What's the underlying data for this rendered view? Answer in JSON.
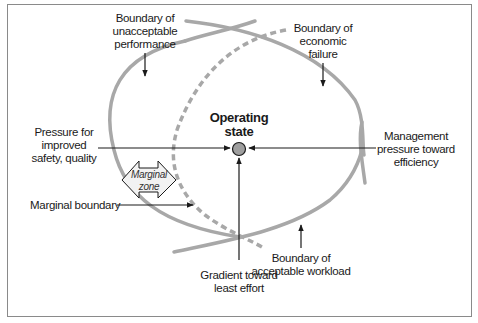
{
  "diagram": {
    "colors": {
      "boundary": "#a8a8a8",
      "arrow": "#1a1a1a",
      "operating_state_fill": "#9e9e9e",
      "frame": "#8a8a8a",
      "marginal_zone_fill": "#f2f2f2"
    },
    "center": {
      "label_line1": "Operating",
      "label_line2": "state"
    },
    "boundaries": {
      "unacceptable_performance": {
        "line1": "Boundary of",
        "line2": "unacceptable",
        "line3": "performance"
      },
      "economic_failure": {
        "line1": "Boundary of",
        "line2": "economic",
        "line3": "failure"
      },
      "acceptable_workload": {
        "line1": "Boundary of",
        "line2": "acceptable workload"
      },
      "marginal": {
        "line1": "Marginal boundary"
      }
    },
    "pressures": {
      "safety": {
        "line1": "Pressure for",
        "line2": "improved",
        "line3": "safety, quality"
      },
      "management": {
        "line1": "Management",
        "line2": "pressure toward",
        "line3": "efficiency"
      },
      "least_effort": {
        "line1": "Gradient toward",
        "line2": "least effort"
      }
    },
    "marginal_zone": {
      "line1": "Marginal",
      "line2": "zone"
    }
  }
}
